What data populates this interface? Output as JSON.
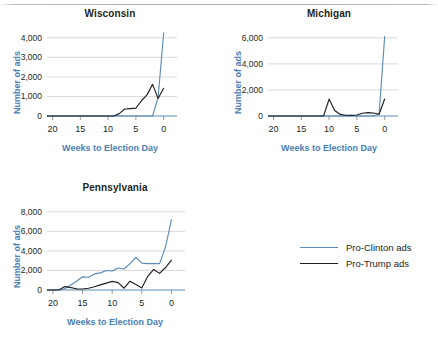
{
  "figure": {
    "xlabel": "Weeks to Election Day",
    "ylabel": "Number of ads"
  },
  "legend": {
    "items": [
      {
        "label": "Pro-Clinton ads",
        "color": "#5b8db8"
      },
      {
        "label": "Pro-Trump ads",
        "color": "#231f20"
      }
    ]
  },
  "chart_data": [
    {
      "type": "line",
      "title": "Wisconsin",
      "xlabel": "Weeks to Election Day",
      "ylabel": "Number of ads",
      "xlim": [
        21,
        -0.6
      ],
      "ylim": [
        0,
        4400
      ],
      "xticks": [
        20,
        15,
        10,
        5,
        0
      ],
      "yticks": [
        0,
        1000,
        2000,
        3000,
        4000
      ],
      "ytick_labels": [
        "0",
        "1,000",
        "2,000",
        "3,000",
        "4,000"
      ],
      "grid": "horizontal",
      "x": [
        21,
        20,
        19,
        18,
        17,
        16,
        15,
        14,
        13,
        12,
        11,
        10,
        9,
        8,
        7,
        6,
        5,
        4,
        3,
        2,
        1,
        0
      ],
      "series": [
        {
          "name": "Pro-Clinton ads",
          "color": "#5b8db8",
          "values": [
            0,
            0,
            0,
            0,
            0,
            0,
            0,
            0,
            0,
            0,
            0,
            0,
            0,
            0,
            0,
            0,
            0,
            0,
            0,
            0,
            950,
            4250
          ]
        },
        {
          "name": "Pro-Trump ads",
          "color": "#231f20",
          "values": [
            0,
            0,
            0,
            0,
            0,
            0,
            0,
            0,
            0,
            0,
            0,
            0,
            0,
            120,
            360,
            380,
            400,
            780,
            1080,
            1620,
            900,
            1420
          ]
        }
      ]
    },
    {
      "type": "line",
      "title": "Michigan",
      "xlabel": "Weeks to Election Day",
      "ylabel": "Number of ads",
      "xlim": [
        21,
        -0.6
      ],
      "ylim": [
        0,
        6600
      ],
      "xticks": [
        20,
        15,
        10,
        5,
        0
      ],
      "yticks": [
        0,
        2000,
        4000,
        6000
      ],
      "ytick_labels": [
        "0",
        "2,000",
        "4,000",
        "6,000"
      ],
      "grid": "horizontal",
      "x": [
        21,
        20,
        19,
        18,
        17,
        16,
        15,
        14,
        13,
        12,
        11,
        10,
        9,
        8,
        7,
        6,
        5,
        4,
        3,
        2,
        1,
        0
      ],
      "series": [
        {
          "name": "Pro-Clinton ads",
          "color": "#5b8db8",
          "values": [
            0,
            0,
            0,
            0,
            0,
            0,
            0,
            0,
            0,
            0,
            0,
            0,
            0,
            0,
            0,
            0,
            0,
            0,
            0,
            0,
            150,
            6100
          ]
        },
        {
          "name": "Pro-Trump ads",
          "color": "#231f20",
          "values": [
            0,
            0,
            0,
            0,
            0,
            0,
            0,
            0,
            0,
            0,
            0,
            1300,
            420,
            120,
            60,
            50,
            80,
            210,
            260,
            230,
            130,
            1300
          ]
        }
      ]
    },
    {
      "type": "line",
      "title": "Pennsylvania",
      "xlabel": "Weeks to Election Day",
      "ylabel": "Number of ads",
      "xlim": [
        21,
        -0.6
      ],
      "ylim": [
        0,
        8800
      ],
      "xticks": [
        20,
        15,
        10,
        5,
        0
      ],
      "yticks": [
        0,
        2000,
        4000,
        6000,
        8000
      ],
      "ytick_labels": [
        "0",
        "2,000",
        "4,000",
        "6,000",
        "8,000"
      ],
      "grid": "horizontal",
      "x": [
        21,
        20,
        19,
        18,
        17,
        16,
        15,
        14,
        13,
        12,
        11,
        10,
        9,
        8,
        7,
        6,
        5,
        4,
        3,
        2,
        1,
        0
      ],
      "series": [
        {
          "name": "Pro-Clinton ads",
          "color": "#5b8db8",
          "values": [
            0,
            0,
            30,
            120,
            520,
            900,
            1350,
            1300,
            1650,
            1750,
            2000,
            1950,
            2250,
            2150,
            2700,
            3350,
            2750,
            2700,
            2700,
            2700,
            4400,
            7200
          ]
        },
        {
          "name": "Pro-Trump ads",
          "color": "#231f20",
          "values": [
            0,
            0,
            0,
            350,
            250,
            120,
            100,
            180,
            330,
            520,
            700,
            880,
            760,
            180,
            900,
            560,
            200,
            1400,
            2100,
            1700,
            2300,
            3050
          ]
        }
      ]
    }
  ]
}
